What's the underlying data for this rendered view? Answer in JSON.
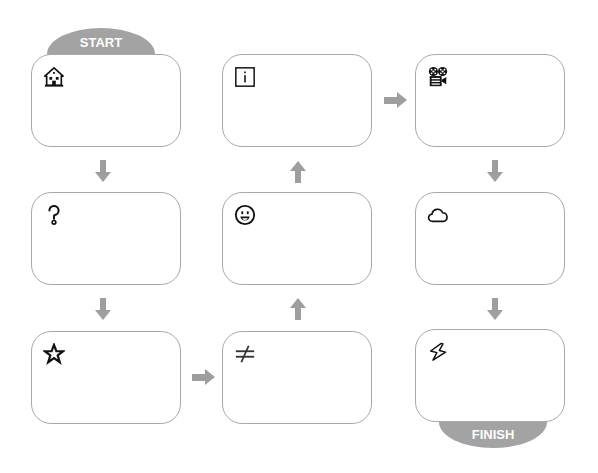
{
  "diagram": {
    "type": "flow",
    "start_label": "START",
    "finish_label": "FINISH",
    "colors": {
      "tab": "#a3a3a3",
      "arrow": "#9e9e9e",
      "box_border": "#a8a8a8",
      "icon": "#111111"
    },
    "steps": [
      {
        "id": 1,
        "icon": "house-icon",
        "text": ""
      },
      {
        "id": 2,
        "icon": "question-mark-icon",
        "text": ""
      },
      {
        "id": 3,
        "icon": "star-icon",
        "text": ""
      },
      {
        "id": 4,
        "icon": "not-equal-icon",
        "text": ""
      },
      {
        "id": 5,
        "icon": "smiley-face-icon",
        "text": ""
      },
      {
        "id": 6,
        "icon": "info-icon",
        "text": ""
      },
      {
        "id": 7,
        "icon": "film-projector-icon",
        "text": ""
      },
      {
        "id": 8,
        "icon": "cloud-icon",
        "text": ""
      },
      {
        "id": 9,
        "icon": "lightning-icon",
        "text": ""
      }
    ],
    "connections": [
      {
        "from": 1,
        "to": 2,
        "direction": "down"
      },
      {
        "from": 2,
        "to": 3,
        "direction": "down"
      },
      {
        "from": 3,
        "to": 4,
        "direction": "right"
      },
      {
        "from": 4,
        "to": 5,
        "direction": "up"
      },
      {
        "from": 5,
        "to": 6,
        "direction": "up"
      },
      {
        "from": 6,
        "to": 7,
        "direction": "right"
      },
      {
        "from": 7,
        "to": 8,
        "direction": "down"
      },
      {
        "from": 8,
        "to": 9,
        "direction": "down"
      }
    ]
  }
}
